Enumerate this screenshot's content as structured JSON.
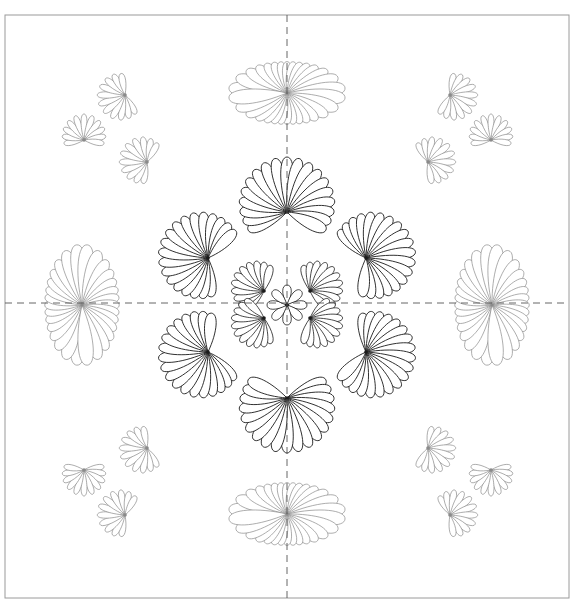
{
  "canvas": {
    "width": 575,
    "height": 612,
    "background": "#ffffff"
  },
  "frame": {
    "x": 5,
    "y": 15,
    "w": 564,
    "h": 583,
    "stroke": "#9a9a9a"
  },
  "guides": {
    "center_x": 287,
    "center_y": 303,
    "stroke": "#555555",
    "dash": "7,5"
  },
  "colors": {
    "main_line": "#1a1a1a",
    "light_line": "#8a8a8a"
  },
  "center_motif": {
    "cx": 287,
    "cy": 303,
    "big_fans": [
      {
        "x": 287,
        "y": 212,
        "r": 55,
        "dir": 270
      },
      {
        "x": 208,
        "y": 258,
        "r": 50,
        "dir": 200
      },
      {
        "x": 366,
        "y": 258,
        "r": 50,
        "dir": 340
      },
      {
        "x": 208,
        "y": 352,
        "r": 50,
        "dir": 160
      },
      {
        "x": 366,
        "y": 352,
        "r": 50,
        "dir": 20
      },
      {
        "x": 287,
        "y": 398,
        "r": 55,
        "dir": 90
      }
    ],
    "inner_fans": [
      {
        "x": 264,
        "y": 291,
        "r": 34,
        "dir": 210
      },
      {
        "x": 310,
        "y": 291,
        "r": 34,
        "dir": 330
      },
      {
        "x": 264,
        "y": 318,
        "r": 34,
        "dir": 150
      },
      {
        "x": 310,
        "y": 318,
        "r": 34,
        "dir": 30
      }
    ],
    "core": {
      "x": 287,
      "y": 305,
      "r": 20
    }
  },
  "side_ovals": [
    {
      "x": 287,
      "y": 93,
      "rx": 60,
      "ry": 32,
      "orient": "h"
    },
    {
      "x": 287,
      "y": 514,
      "rx": 60,
      "ry": 32,
      "orient": "h"
    },
    {
      "x": 82,
      "y": 305,
      "rx": 38,
      "ry": 62,
      "orient": "v"
    },
    {
      "x": 492,
      "y": 305,
      "rx": 38,
      "ry": 62,
      "orient": "v"
    }
  ],
  "corner_clusters": [
    {
      "name": "top-left",
      "fans": [
        {
          "x": 125,
          "y": 95,
          "r": 28,
          "dir": 160
        },
        {
          "x": 84,
          "y": 140,
          "r": 26,
          "dir": 270
        },
        {
          "x": 147,
          "y": 162,
          "r": 28,
          "dir": 200
        }
      ]
    },
    {
      "name": "top-right",
      "fans": [
        {
          "x": 450,
          "y": 95,
          "r": 28,
          "dir": 20
        },
        {
          "x": 491,
          "y": 140,
          "r": 26,
          "dir": 270
        },
        {
          "x": 428,
          "y": 162,
          "r": 28,
          "dir": 340
        }
      ]
    },
    {
      "name": "bottom-left",
      "fans": [
        {
          "x": 84,
          "y": 470,
          "r": 26,
          "dir": 90
        },
        {
          "x": 147,
          "y": 448,
          "r": 28,
          "dir": 160
        },
        {
          "x": 125,
          "y": 515,
          "r": 28,
          "dir": 200
        }
      ]
    },
    {
      "name": "bottom-right",
      "fans": [
        {
          "x": 491,
          "y": 470,
          "r": 26,
          "dir": 90
        },
        {
          "x": 428,
          "y": 448,
          "r": 28,
          "dir": 20
        },
        {
          "x": 450,
          "y": 515,
          "r": 28,
          "dir": 340
        }
      ]
    }
  ]
}
